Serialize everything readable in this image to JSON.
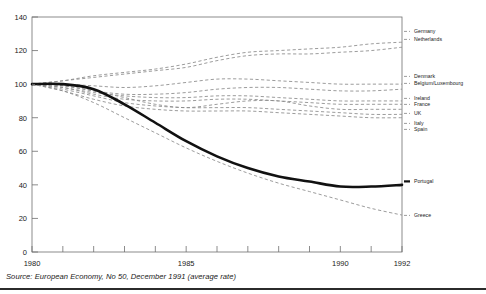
{
  "figure": {
    "source_note": "Source: European Economy, No 50, December 1991 (average rate)"
  },
  "axes": {
    "y_ticks": [
      "0",
      "20",
      "40",
      "60",
      "80",
      "100",
      "120",
      "140"
    ],
    "x_ticks": [
      "1980",
      "1985",
      "1990",
      "1992"
    ]
  },
  "chart_data": {
    "type": "line",
    "title": "",
    "subtitle": "",
    "xlabel": "",
    "ylabel": "",
    "xlim": [
      1980,
      1992
    ],
    "ylim": [
      0,
      140
    ],
    "grid": false,
    "legend_position": "right-inline-labels",
    "x": [
      1980,
      1981,
      1982,
      1983,
      1984,
      1985,
      1986,
      1987,
      1988,
      1989,
      1990,
      1991,
      1992
    ],
    "series": [
      {
        "name": "Germany",
        "label": "Germany",
        "style": "dashed",
        "color": "#8a8a8a",
        "label_y": 33,
        "values": [
          100,
          102,
          105,
          107,
          109,
          112,
          116,
          119,
          120,
          121,
          122,
          124,
          125
        ]
      },
      {
        "name": "Netherlands",
        "label": "Netherlands",
        "style": "dashed",
        "color": "#8a8a8a",
        "label_y": 41,
        "values": [
          100,
          102,
          104,
          106,
          108,
          110,
          114,
          117,
          118,
          118,
          119,
          120,
          122
        ]
      },
      {
        "name": "Denmark",
        "label": "Denmark",
        "style": "dashed",
        "color": "#8a8a8a",
        "label_y": 78,
        "values": [
          100,
          100,
          99,
          98,
          99,
          101,
          103,
          103,
          102,
          101,
          100,
          100,
          100
        ]
      },
      {
        "name": "Belgium/Luxembourg",
        "label": "Belgium/Luxembourg",
        "style": "dashed",
        "color": "#8a8a8a",
        "label_y": 85,
        "values": [
          100,
          99,
          96,
          94,
          94,
          95,
          97,
          98,
          98,
          97,
          96,
          96,
          97
        ]
      },
      {
        "name": "Ireland",
        "label": "Ireland",
        "style": "dashed",
        "color": "#8a8a8a",
        "label_y": 100,
        "values": [
          100,
          98,
          95,
          93,
          92,
          92,
          93,
          93,
          92,
          91,
          90,
          90,
          90
        ]
      },
      {
        "name": "France",
        "label": "France",
        "style": "dashed",
        "color": "#8a8a8a",
        "label_y": 106,
        "values": [
          100,
          98,
          94,
          91,
          90,
          90,
          91,
          91,
          90,
          89,
          88,
          88,
          88
        ]
      },
      {
        "name": "UK",
        "label": "UK",
        "style": "dashed",
        "color": "#8a8a8a",
        "label_y": 115,
        "values": [
          100,
          99,
          96,
          92,
          88,
          86,
          88,
          90,
          90,
          87,
          85,
          85,
          85
        ]
      },
      {
        "name": "Italy",
        "label": "Italy",
        "style": "dashed",
        "color": "#8a8a8a",
        "label_y": 125,
        "values": [
          100,
          97,
          93,
          89,
          87,
          86,
          86,
          86,
          85,
          84,
          83,
          82,
          82
        ]
      },
      {
        "name": "Spain",
        "label": "Spain",
        "style": "dashed",
        "color": "#8a8a8a",
        "label_y": 131,
        "values": [
          100,
          96,
          91,
          87,
          85,
          84,
          84,
          84,
          83,
          82,
          81,
          80,
          80
        ]
      },
      {
        "name": "Portugal",
        "label": "Portugal",
        "style": "bold-solid",
        "color": "#111111",
        "label_y": 183,
        "values": [
          100,
          100,
          97,
          88,
          77,
          66,
          57,
          50,
          45,
          42,
          39,
          39,
          40
        ]
      },
      {
        "name": "Greece",
        "label": "Greece",
        "style": "dashed",
        "color": "#8a8a8a",
        "label_y": 217,
        "values": [
          100,
          96,
          89,
          80,
          71,
          62,
          54,
          47,
          41,
          36,
          31,
          26,
          22
        ]
      }
    ]
  }
}
